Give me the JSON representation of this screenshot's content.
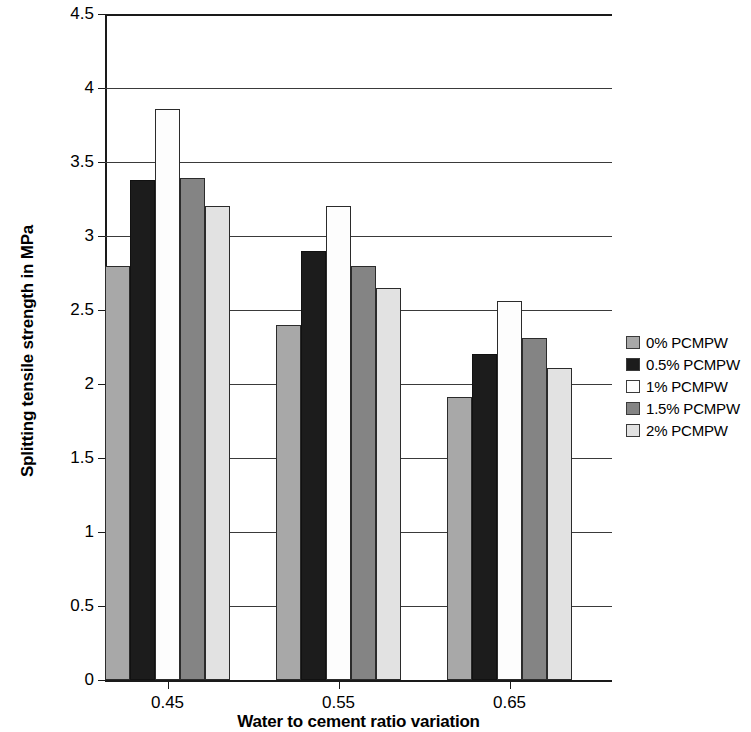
{
  "chart_data": {
    "type": "bar",
    "title": "",
    "xlabel": "Water to cement ratio variation",
    "ylabel": "Splitting tensile strength in MPa",
    "categories": [
      "0.45",
      "0.55",
      "0.65"
    ],
    "ylim": [
      0,
      4.5
    ],
    "yticks": [
      "0",
      "0.5",
      "1",
      "1.5",
      "2",
      "2.5",
      "3",
      "3.5",
      "4",
      "4.5"
    ],
    "ytick_values": [
      0,
      0.5,
      1,
      1.5,
      2,
      2.5,
      3,
      3.5,
      4,
      4.5
    ],
    "grid": true,
    "legend_position": "right",
    "series": [
      {
        "name": "0% PCMPW",
        "color": "#a8a8a8",
        "values": [
          2.8,
          2.4,
          1.91
        ]
      },
      {
        "name": "0.5% PCMPW",
        "color": "#1c1c1c",
        "values": [
          3.38,
          2.9,
          2.2
        ]
      },
      {
        "name": "1% PCMPW",
        "color": "#fdfdfd",
        "values": [
          3.86,
          3.2,
          2.56
        ]
      },
      {
        "name": "1.5% PCMPW",
        "color": "#848484",
        "values": [
          3.39,
          2.8,
          2.31
        ]
      },
      {
        "name": "2% PCMPW",
        "color": "#e2e2e2",
        "values": [
          3.2,
          2.65,
          2.11
        ]
      }
    ]
  }
}
